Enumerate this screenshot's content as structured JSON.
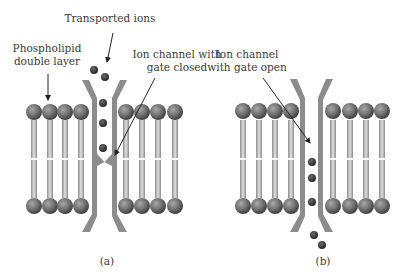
{
  "panels": [
    {
      "id": "a",
      "caption": "(a)",
      "state": "gate closed",
      "labels": {
        "ions": "Transported ions",
        "bilayer_line1": "Phospholipid",
        "bilayer_line2": "double layer",
        "channel_line1": "Ion channel with",
        "channel_line2": "gate closed"
      }
    },
    {
      "id": "b",
      "caption": "(b)",
      "state": "gate open",
      "labels": {
        "channel_line1": "Ion channel",
        "channel_line2": "with gate open"
      }
    }
  ],
  "colors": {
    "head": "#6e6e6e",
    "head_dark": "#404040",
    "channel": "#8c8c8c",
    "ion": "#3a3a3a",
    "tail": "#b5b5b5"
  }
}
